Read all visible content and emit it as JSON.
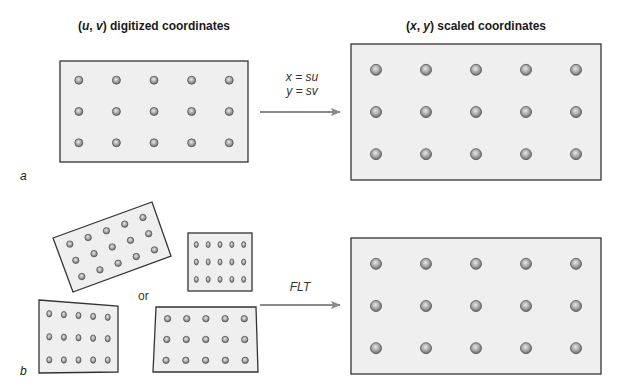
{
  "titles": {
    "left": {
      "open": "(",
      "var1": "u",
      "sep": ", ",
      "var2": "v",
      "close": ")",
      "rest": " digitized coordinates"
    },
    "right": {
      "open": "(",
      "var1": "x",
      "sep": ", ",
      "var2": "y",
      "close": ")",
      "rest": " scaled coordinates"
    }
  },
  "panel_a": {
    "label": "a",
    "equations": [
      "x = su",
      "y = sv"
    ],
    "arrow_from": "digitized-grid",
    "arrow_to": "scaled-grid"
  },
  "panel_b": {
    "label": "b",
    "or_label": "or",
    "transform_label": "FLT",
    "input_variants": [
      "rotated-grid",
      "compressed-grid",
      "keystone-left-grid",
      "keystone-right-grid"
    ]
  },
  "grid": {
    "rows": 3,
    "cols": 5
  },
  "colors": {
    "box_fill": "#efefef",
    "box_stroke": "#333333",
    "arrow": "#8a8a8a",
    "dot_outer": "#555555",
    "dot_inner": "#b5b5b5"
  }
}
